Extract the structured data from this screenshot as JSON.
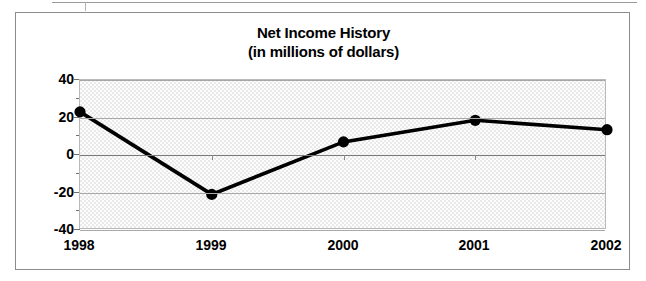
{
  "chart_data": {
    "type": "line",
    "title": "Net Income History",
    "subtitle": "(in millions of dollars)",
    "xlabel": "",
    "ylabel": "",
    "categories": [
      "1998",
      "1999",
      "2000",
      "2001",
      "2002"
    ],
    "values": [
      23,
      -21,
      7,
      18.5,
      13.5
    ],
    "series": [
      {
        "name": "Net Income",
        "values": [
          23,
          -21,
          7,
          18.5,
          13.5
        ]
      }
    ],
    "ylim": [
      -40,
      40
    ],
    "y_ticks": [
      40,
      20,
      0,
      -20,
      -40
    ],
    "y_tick_labels": [
      "40",
      "20",
      "0",
      "-20",
      "-40"
    ],
    "y_minor_ticks": [
      30,
      10,
      -10,
      -30
    ],
    "grid": true,
    "legend": "none",
    "units": "millions of dollars",
    "marker": "filled-circle",
    "line_color": "#000000",
    "marker_color": "#000000",
    "plot_background": "#e9e9e9",
    "gridline_color": "#a8a8a8"
  },
  "frame": {
    "border_color": "#8c8c8c"
  },
  "scan_artifact": {
    "name": "table-fragment-above"
  }
}
